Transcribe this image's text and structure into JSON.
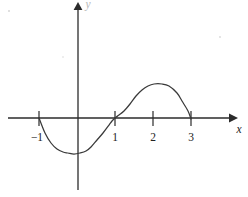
{
  "figure": {
    "kind": "cartesian-graph",
    "background_color": "#ffffff",
    "ink_color": "#2b2b2b",
    "curve_color": "#3a3a3a"
  },
  "axes": {
    "x_axis": {
      "label": "x",
      "label_style": "italic",
      "arrow": "right",
      "pixel_y": 118,
      "pixel_x_start": 8,
      "pixel_x_end": 236
    },
    "y_axis": {
      "label": "y",
      "label_style": "italic",
      "arrow": "up",
      "pixel_x": 78,
      "pixel_y_start": 190,
      "pixel_y_end": 4
    },
    "origin_px": {
      "x": 78,
      "y": 118
    },
    "x_unit_px": 38
  },
  "ticks": {
    "x": [
      {
        "value": -1,
        "label": "−1",
        "pixel_x": 39
      },
      {
        "value": 1,
        "label": "1",
        "pixel_x": 115
      },
      {
        "value": 2,
        "label": "2",
        "pixel_x": 153
      },
      {
        "value": 3,
        "label": "3",
        "pixel_x": 191
      }
    ],
    "y": []
  },
  "chart_data": {
    "type": "line",
    "title": "",
    "subtitle": "",
    "xlabel": "x",
    "ylabel": "y",
    "xlim": [
      -1.85,
      4.15
    ],
    "ylim": [
      -1.9,
      3.05
    ],
    "grid": false,
    "legend": null,
    "series": [
      {
        "name": "curve",
        "description": "Smooth curve crossing the x-axis at x = -1, x = 1 (flat inflection) and x = 3, with a local minimum just right of the y-axis and a local maximum near x = 2.2",
        "roots": [
          -1,
          1,
          3
        ],
        "local_minimum": {
          "x": 0.05,
          "y": -1.45
        },
        "local_maximum": {
          "x": 2.2,
          "y": 1.4
        },
        "inflection_flat_at": {
          "x": 1,
          "y": 0
        },
        "x": [
          -1.0,
          -0.85,
          -0.7,
          -0.55,
          -0.4,
          -0.25,
          -0.1,
          0.05,
          0.2,
          0.35,
          0.5,
          0.65,
          0.8,
          0.9,
          1.0,
          1.1,
          1.25,
          1.4,
          1.55,
          1.7,
          1.85,
          2.0,
          2.2,
          2.4,
          2.6,
          2.75,
          2.9,
          3.0
        ],
        "y": [
          0.0,
          -0.62,
          -1.03,
          -1.27,
          -1.4,
          -1.45,
          -1.46,
          -1.45,
          -1.36,
          -1.18,
          -0.92,
          -0.6,
          -0.28,
          -0.11,
          0.0,
          0.09,
          0.27,
          0.55,
          0.9,
          1.16,
          1.32,
          1.38,
          1.4,
          1.3,
          1.02,
          0.7,
          0.3,
          -0.04
        ],
        "pixel_points": [
          [
            39,
            118
          ],
          [
            45,
            133
          ],
          [
            51,
            143
          ],
          [
            57,
            149
          ],
          [
            63,
            152
          ],
          [
            68,
            153
          ],
          [
            74,
            154
          ],
          [
            80,
            153
          ],
          [
            86,
            151
          ],
          [
            91,
            147
          ],
          [
            97,
            140
          ],
          [
            103,
            133
          ],
          [
            109,
            125
          ],
          [
            112,
            121
          ],
          [
            115,
            118
          ],
          [
            119,
            115
          ],
          [
            124,
            111
          ],
          [
            130,
            104
          ],
          [
            136,
            96
          ],
          [
            142,
            90
          ],
          [
            148,
            86
          ],
          [
            154,
            84
          ],
          [
            162,
            84
          ],
          [
            169,
            86
          ],
          [
            177,
            93
          ],
          [
            182,
            101
          ],
          [
            188,
            111
          ],
          [
            191,
            119
          ]
        ]
      }
    ]
  },
  "annotations": []
}
